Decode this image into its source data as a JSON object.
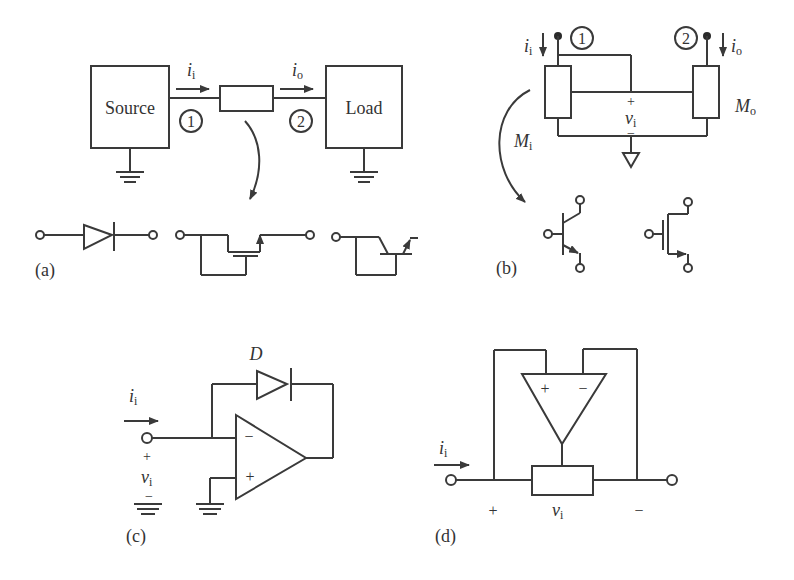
{
  "figure": {
    "panel_a": {
      "label": "(a)",
      "source_label": "Source",
      "load_label": "Load",
      "input_current": "i",
      "input_current_sub": "i",
      "output_current": "i",
      "output_current_sub": "o",
      "port_1": "1",
      "port_2": "2",
      "devices": [
        "diode",
        "mosfet-switch",
        "bjt-switch"
      ]
    },
    "panel_b": {
      "label": "(b)",
      "input_current": "i",
      "input_current_sub": "i",
      "output_current": "i",
      "output_current_sub": "o",
      "port_1": "1",
      "port_2": "2",
      "input_module": "M",
      "input_module_sub": "i",
      "output_module": "M",
      "output_module_sub": "o",
      "voltage": "v",
      "voltage_sub": "i",
      "plus": "+",
      "minus": "−",
      "devices": [
        "npn-bjt",
        "n-mosfet"
      ]
    },
    "panel_c": {
      "label": "(c)",
      "diode_label": "D",
      "input_current": "i",
      "input_current_sub": "i",
      "voltage": "v",
      "voltage_sub": "i",
      "plus": "+",
      "minus": "−",
      "opamp_minus": "−",
      "opamp_plus": "+"
    },
    "panel_d": {
      "label": "(d)",
      "input_current": "i",
      "input_current_sub": "i",
      "voltage": "v",
      "voltage_sub": "i",
      "plus": "+",
      "minus": "−",
      "opamp_plus": "+",
      "opamp_minus": "−"
    }
  }
}
